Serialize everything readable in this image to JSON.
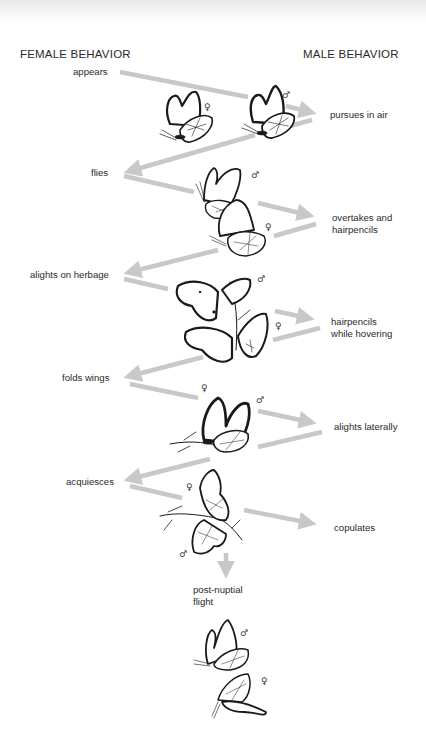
{
  "headers": {
    "female": "FEMALE BEHAVIOR",
    "male": "MALE BEHAVIOR"
  },
  "female_steps": [
    {
      "label": "appears"
    },
    {
      "label": "flies"
    },
    {
      "label": "alights on herbage"
    },
    {
      "label": "folds wings"
    },
    {
      "label": "acquiesces"
    }
  ],
  "male_steps": [
    {
      "label": "pursues in air"
    },
    {
      "label": "overtakes and\nhairpencils",
      "line1": "overtakes and",
      "line2": "hairpencils"
    },
    {
      "label": "hairpencils\nwhile hovering",
      "line1": "hairpencils",
      "line2": "while hovering"
    },
    {
      "label": "alights laterally"
    },
    {
      "label": "copulates"
    }
  ],
  "final_step": {
    "line1": "post-nuptial",
    "line2": "flight"
  },
  "symbols": {
    "female": "♀",
    "male": "♂"
  },
  "colors": {
    "arrow": "#c8c8c8",
    "ink": "#1a1a1a",
    "text": "#2a2a2a"
  }
}
